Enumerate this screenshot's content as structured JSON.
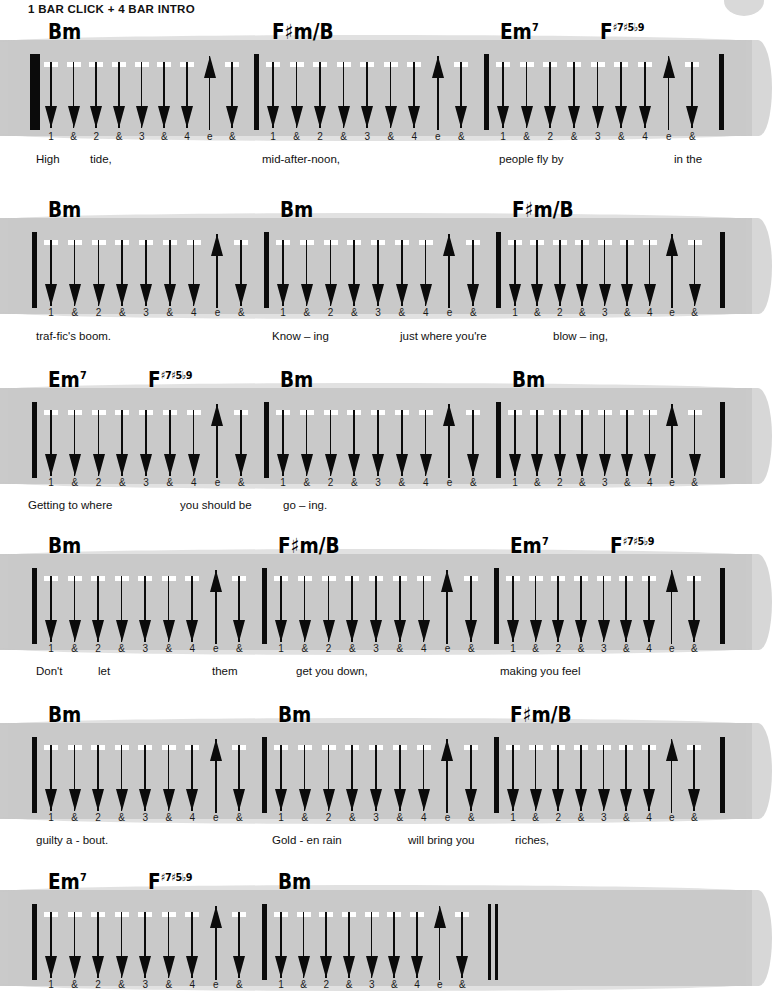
{
  "header": {
    "title": "1 BAR CLICK + 4 BAR INTRO"
  },
  "colors": {
    "brush_gray": "#c9c9c9",
    "ink": "#0b0b0b",
    "page": "#ffffff"
  },
  "strum_legend": {
    "down": "down-strum",
    "up": "up-strum",
    "counts": [
      "1",
      "&",
      "2",
      "&",
      "3",
      "&",
      "4",
      "e",
      "&"
    ],
    "pattern": [
      "down",
      "down",
      "down",
      "down",
      "down",
      "down",
      "down",
      "up",
      "down"
    ]
  },
  "chart_data": {
    "type": "table",
    "title": "1 BAR CLICK + 4 BAR INTRO",
    "time_signature_counts": [
      "1",
      "&",
      "2",
      "&",
      "3",
      "&",
      "4",
      "e",
      "&"
    ],
    "strum_pattern": [
      "down",
      "down",
      "down",
      "down",
      "down",
      "down",
      "down",
      "up",
      "down"
    ],
    "systems": [
      {
        "index": 1,
        "start_barline": "double",
        "end_barline": "single",
        "measures": [
          {
            "chord": {
              "root": "B",
              "quality": "m",
              "sup": ""
            },
            "chord_text": "Bm"
          },
          {
            "chord": {
              "root": "F",
              "acc": "#",
              "quality": "m/B",
              "sup": ""
            },
            "chord_text": "F#m/B"
          },
          {
            "chord": {
              "root": "E",
              "quality": "m",
              "sup": "7"
            },
            "chord_text": "Em7"
          },
          {
            "chord": {
              "root": "F",
              "quality": "",
              "sup": "#7#5b9"
            },
            "chord_text": "F#7#5b9"
          }
        ],
        "lyrics": [
          "High",
          "tide,",
          "mid-after-noon,",
          "people fly by",
          "in  the"
        ]
      },
      {
        "index": 2,
        "start_barline": "single",
        "end_barline": "single",
        "measures": [
          {
            "chord": {
              "root": "B",
              "quality": "m",
              "sup": ""
            },
            "chord_text": "Bm"
          },
          {
            "chord": {
              "root": "B",
              "quality": "m",
              "sup": ""
            },
            "chord_text": "Bm"
          },
          {
            "chord": {
              "root": "F",
              "acc": "#",
              "quality": "m/B",
              "sup": ""
            },
            "chord_text": "F#m/B"
          }
        ],
        "lyrics": [
          "traf-fic's boom.",
          "Know  –  ing",
          "just where you're",
          "blow – ing,"
        ]
      },
      {
        "index": 3,
        "start_barline": "single",
        "end_barline": "single",
        "measures": [
          {
            "chord": {
              "root": "E",
              "quality": "m",
              "sup": "7"
            },
            "chord_text": "Em7"
          },
          {
            "chord": {
              "root": "F",
              "quality": "",
              "sup": "#7#5b9"
            },
            "chord_text": "F#7#5b9"
          },
          {
            "chord": {
              "root": "B",
              "quality": "m",
              "sup": ""
            },
            "chord_text": "Bm"
          },
          {
            "chord": {
              "root": "B",
              "quality": "m",
              "sup": ""
            },
            "chord_text": "Bm"
          }
        ],
        "lyrics": [
          "Getting to where",
          "you should be",
          "go –  ing."
        ]
      },
      {
        "index": 4,
        "start_barline": "single",
        "end_barline": "single",
        "measures": [
          {
            "chord": {
              "root": "B",
              "quality": "m",
              "sup": ""
            },
            "chord_text": "Bm"
          },
          {
            "chord": {
              "root": "F",
              "acc": "#",
              "quality": "m/B",
              "sup": ""
            },
            "chord_text": "F#m/B"
          },
          {
            "chord": {
              "root": "E",
              "quality": "m",
              "sup": "7"
            },
            "chord_text": "Em7"
          },
          {
            "chord": {
              "root": "F",
              "quality": "",
              "sup": "#7#5b9"
            },
            "chord_text": "F#7#5b9"
          }
        ],
        "lyrics": [
          "Don't",
          "let",
          "them",
          "get you down,",
          "making you feel"
        ]
      },
      {
        "index": 5,
        "start_barline": "single",
        "end_barline": "single",
        "measures": [
          {
            "chord": {
              "root": "B",
              "quality": "m",
              "sup": ""
            },
            "chord_text": "Bm"
          },
          {
            "chord": {
              "root": "B",
              "quality": "m",
              "sup": ""
            },
            "chord_text": "Bm"
          },
          {
            "chord": {
              "root": "F",
              "acc": "#",
              "quality": "m/B",
              "sup": ""
            },
            "chord_text": "F#m/B"
          }
        ],
        "lyrics": [
          "guilty a - bout.",
          "Gold - en rain",
          "will bring you",
          "riches,"
        ]
      },
      {
        "index": 6,
        "start_barline": "single",
        "end_barline": "double",
        "measures": [
          {
            "chord": {
              "root": "E",
              "quality": "m",
              "sup": "7"
            },
            "chord_text": "Em7"
          },
          {
            "chord": {
              "root": "F",
              "quality": "",
              "sup": "#7#5b9"
            },
            "chord_text": "F#7#5b9"
          },
          {
            "chord": {
              "root": "B",
              "quality": "m",
              "sup": ""
            },
            "chord_text": "Bm"
          }
        ],
        "lyrics": []
      }
    ]
  },
  "systems": [
    {
      "top": 40,
      "measures": [
        {
          "left": 36,
          "width": 222,
          "chords": [
            {
              "x": 12,
              "text_html": "Bm"
            }
          ]
        },
        {
          "left": 258,
          "width": 230,
          "chords": [
            {
              "x": 14,
              "text_html": "F♯m/B"
            }
          ]
        },
        {
          "left": 488,
          "width": 231,
          "chords": [
            {
              "x": 12,
              "text_html": "Em7"
            },
            {
              "x": 112,
              "text_html": "F#7#5b9"
            }
          ]
        }
      ],
      "counts_y": 131,
      "lyrics_y": 153,
      "lyrics": [
        {
          "x": 36,
          "text": "High"
        },
        {
          "x": 90,
          "text": "tide,"
        },
        {
          "x": 262,
          "text": "mid-after-noon,"
        },
        {
          "x": 499,
          "text": "people fly by"
        },
        {
          "x": 674,
          "text": "in  the"
        }
      ],
      "start_double": true,
      "end_bar": 719
    },
    {
      "top": 218,
      "measures": [
        {
          "left": 36,
          "width": 232,
          "chords": [
            {
              "x": 12,
              "text_html": "Bm"
            }
          ]
        },
        {
          "left": 268,
          "width": 232,
          "chords": [
            {
              "x": 12,
              "text_html": "Bm"
            }
          ]
        },
        {
          "left": 500,
          "width": 220,
          "chords": [
            {
              "x": 12,
              "text_html": "F♯m/B"
            }
          ]
        }
      ],
      "counts_y": 307,
      "lyrics_y": 330,
      "lyrics": [
        {
          "x": 36,
          "text": "traf-fic's boom."
        },
        {
          "x": 272,
          "text": "Know  –  ing"
        },
        {
          "x": 400,
          "text": "just where you're"
        },
        {
          "x": 553,
          "text": "blow – ing,"
        }
      ],
      "start_double": false,
      "end_bar": 720
    },
    {
      "top": 388,
      "measures": [
        {
          "left": 36,
          "width": 232,
          "chords": [
            {
              "x": 12,
              "text_html": "Em7"
            },
            {
              "x": 112,
              "text_html": "F#7#5b9"
            }
          ]
        },
        {
          "left": 268,
          "width": 232,
          "chords": [
            {
              "x": 12,
              "text_html": "Bm"
            }
          ]
        },
        {
          "left": 500,
          "width": 220,
          "chords": [
            {
              "x": 12,
              "text_html": "Bm"
            }
          ]
        }
      ],
      "counts_y": 477,
      "lyrics_y": 499,
      "lyrics": [
        {
          "x": 28,
          "text": "Getting to where"
        },
        {
          "x": 180,
          "text": "you should be"
        },
        {
          "x": 283,
          "text": "go  –  ing."
        }
      ],
      "start_double": false,
      "end_bar": 720
    },
    {
      "top": 554,
      "measures": [
        {
          "left": 36,
          "width": 230,
          "chords": [
            {
              "x": 12,
              "text_html": "Bm"
            }
          ]
        },
        {
          "left": 266,
          "width": 232,
          "chords": [
            {
              "x": 12,
              "text_html": "F♯m/B"
            }
          ]
        },
        {
          "left": 498,
          "width": 222,
          "chords": [
            {
              "x": 12,
              "text_html": "Em7"
            },
            {
              "x": 112,
              "text_html": "F#7#5b9"
            }
          ]
        }
      ],
      "counts_y": 643,
      "lyrics_y": 665,
      "lyrics": [
        {
          "x": 36,
          "text": "Don't"
        },
        {
          "x": 98,
          "text": "let"
        },
        {
          "x": 212,
          "text": "them"
        },
        {
          "x": 296,
          "text": "get you down,"
        },
        {
          "x": 500,
          "text": "making you feel"
        }
      ],
      "start_double": false,
      "end_bar": 720
    },
    {
      "top": 723,
      "measures": [
        {
          "left": 36,
          "width": 230,
          "chords": [
            {
              "x": 12,
              "text_html": "Bm"
            }
          ]
        },
        {
          "left": 266,
          "width": 232,
          "chords": [
            {
              "x": 12,
              "text_html": "Bm"
            }
          ]
        },
        {
          "left": 498,
          "width": 222,
          "chords": [
            {
              "x": 12,
              "text_html": "F♯m/B"
            }
          ]
        }
      ],
      "counts_y": 812,
      "lyrics_y": 834,
      "lyrics": [
        {
          "x": 36,
          "text": "guilty a - bout."
        },
        {
          "x": 272,
          "text": "Gold - en rain"
        },
        {
          "x": 408,
          "text": "will bring you"
        },
        {
          "x": 515,
          "text": "riches,"
        }
      ],
      "start_double": false,
      "end_bar": 720
    },
    {
      "top": 890,
      "measures": [
        {
          "left": 36,
          "width": 230,
          "chords": [
            {
              "x": 12,
              "text_html": "Em7"
            },
            {
              "x": 112,
              "text_html": "F#7#5b9"
            }
          ]
        },
        {
          "left": 266,
          "width": 222,
          "chords": [
            {
              "x": 12,
              "text_html": "Bm"
            }
          ]
        }
      ],
      "counts_y": 979,
      "lyrics_y": 1001,
      "lyrics": [],
      "start_double": false,
      "end_bar": 488,
      "end_double": true,
      "brush_width": 752,
      "short": true
    }
  ]
}
